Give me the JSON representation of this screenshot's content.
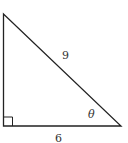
{
  "diagram": {
    "type": "right-triangle",
    "hypotenuse_label": "9",
    "base_label": "6",
    "angle_label": "θ",
    "right_angle_marker": true,
    "colors": {
      "stroke": "#222222",
      "text": "#333333",
      "background": "#ffffff"
    }
  }
}
